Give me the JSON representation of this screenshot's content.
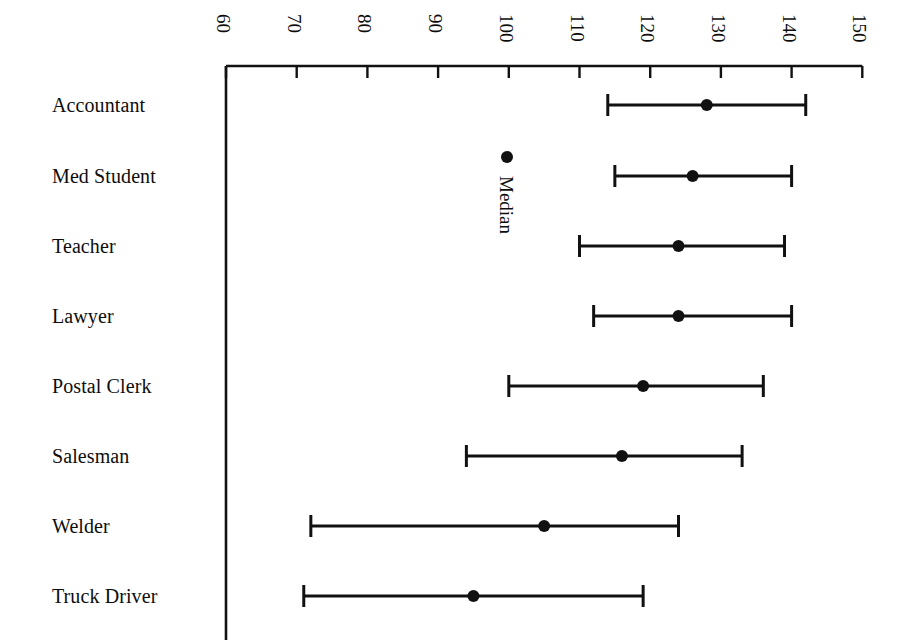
{
  "chart_data": {
    "type": "scatter",
    "title": "",
    "subtitle": "",
    "xlabel": "",
    "ylabel": "",
    "orientation": "horizontal",
    "grid": false,
    "legend_position": "inline-annotation",
    "xlim": [
      60,
      150
    ],
    "xticks": [
      60,
      70,
      80,
      90,
      100,
      110,
      120,
      130,
      140,
      150
    ],
    "xtick_labels": [
      "60",
      "70",
      "80",
      "90",
      "100",
      "110",
      "120",
      "130",
      "140",
      "150"
    ],
    "xtick_rotation_deg": 90,
    "axis_position": "top",
    "categories": [
      "Accountant",
      "Med Student",
      "Teacher",
      "Lawyer",
      "Postal Clerk",
      "Salesman",
      "Welder",
      "Truck Driver"
    ],
    "series": [
      {
        "name": "Median",
        "marker": "filled-circle",
        "values": [
          128,
          126,
          124,
          124,
          119,
          116,
          105,
          95
        ]
      },
      {
        "name": "Range low",
        "marker": "capped-whisker",
        "values": [
          114,
          115,
          110,
          112,
          100,
          94,
          72,
          71
        ]
      },
      {
        "name": "Range high",
        "marker": "capped-whisker",
        "values": [
          142,
          140,
          139,
          140,
          136,
          133,
          124,
          119
        ]
      }
    ],
    "points": [
      {
        "category": "Accountant",
        "low": 114,
        "median": 128,
        "high": 142
      },
      {
        "category": "Med Student",
        "low": 115,
        "median": 126,
        "high": 140
      },
      {
        "category": "Teacher",
        "low": 110,
        "median": 124,
        "high": 139
      },
      {
        "category": "Lawyer",
        "low": 112,
        "median": 124,
        "high": 140
      },
      {
        "category": "Postal Clerk",
        "low": 100,
        "median": 119,
        "high": 136
      },
      {
        "category": "Salesman",
        "low": 94,
        "median": 116,
        "high": 133
      },
      {
        "category": "Welder",
        "low": 72,
        "median": 105,
        "high": 124
      },
      {
        "category": "Truck Driver",
        "low": 71,
        "median": 95,
        "high": 119
      }
    ],
    "annotations": [
      {
        "name": "median-legend",
        "label": "Median",
        "marker": "filled-circle",
        "x": 100,
        "rotation_deg": 90
      }
    ],
    "colors": {
      "ink": "#111111",
      "background": "#ffffff",
      "marker": "#111111",
      "axis": "#111111"
    }
  },
  "geometry": {
    "axis_x_px": 226,
    "axis_y_px": 66,
    "px_per_unit": 7.07,
    "x_origin_value": 60,
    "row_y_px": [
      105,
      176,
      246,
      316,
      386,
      456,
      526,
      596
    ],
    "label_x_px": 52,
    "tick_len_px": 12,
    "cap_half_px": 11,
    "marker_radius_px": 6,
    "annot_dot": {
      "x_px": 507,
      "y_px": 157
    },
    "annot_text": {
      "x_px": 516,
      "y_px": 176
    }
  }
}
